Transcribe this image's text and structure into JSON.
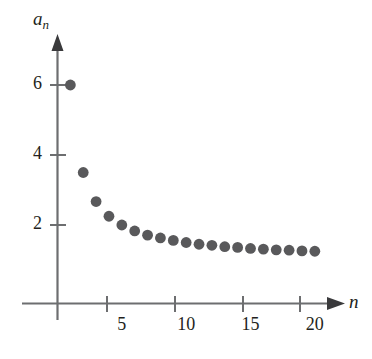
{
  "chart_data": {
    "type": "scatter",
    "title": "",
    "xlabel": "n",
    "ylabel": "a_n",
    "ylabel_base": "a",
    "ylabel_sub": "n",
    "xlim": [
      0,
      22.5
    ],
    "ylim": [
      0,
      7.2
    ],
    "xticks": [
      5,
      10,
      15,
      20
    ],
    "xtick_labels": [
      "5",
      "10",
      "15",
      "20"
    ],
    "yticks": [
      2,
      4,
      6
    ],
    "ytick_labels": [
      "2",
      "4",
      "6"
    ],
    "grid": false,
    "legend": "none",
    "marker": "filled-circle",
    "marker_color": "#59595b",
    "axis_color": "#6d6e70",
    "text_color": "#231f20",
    "formula": "a_n = 1 + 5/n",
    "x": [
      1,
      2,
      3,
      4,
      5,
      6,
      7,
      8,
      9,
      10,
      11,
      12,
      13,
      14,
      15,
      16,
      17,
      18,
      19,
      20
    ],
    "values": [
      6,
      3.5,
      2.67,
      2.25,
      2,
      1.83,
      1.71,
      1.63,
      1.56,
      1.5,
      1.45,
      1.42,
      1.38,
      1.36,
      1.33,
      1.31,
      1.29,
      1.28,
      1.26,
      1.25
    ]
  },
  "figure": {
    "caption": ""
  }
}
